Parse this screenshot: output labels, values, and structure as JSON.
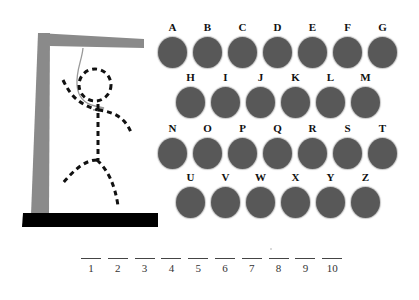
{
  "game": "Hangman",
  "gallows": {
    "post_color": "#8a8a8a",
    "base_color": "#000000",
    "figure_style": "dashed"
  },
  "keyboard": {
    "key_color": "#585858",
    "rows": [
      [
        "A",
        "B",
        "C",
        "D",
        "E",
        "F",
        "G"
      ],
      [
        "H",
        "I",
        "J",
        "K",
        "L",
        "M"
      ],
      [
        "N",
        "O",
        "P",
        "Q",
        "R",
        "S",
        "T"
      ],
      [
        "U",
        "V",
        "W",
        "X",
        "Y",
        "Z"
      ]
    ]
  },
  "word_slots": [
    "1",
    "2",
    "3",
    "4",
    "5",
    "6",
    "7",
    "8",
    "9",
    "10"
  ]
}
